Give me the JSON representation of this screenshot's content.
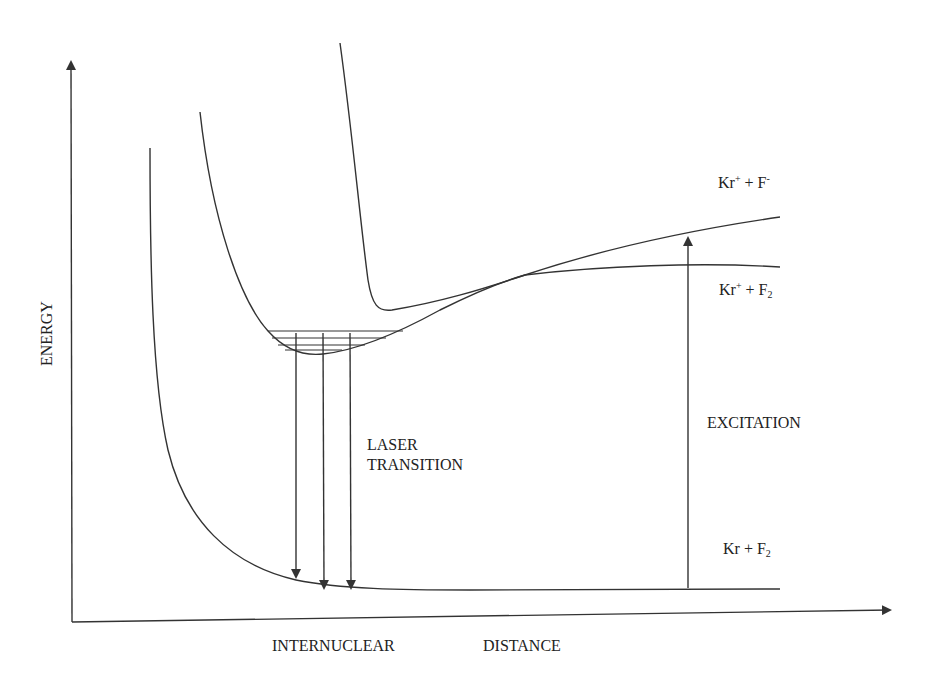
{
  "diagram": {
    "axes": {
      "y_label": "ENERGY",
      "x_label_1": "INTERNUCLEAR",
      "x_label_2": "DISTANCE"
    },
    "curves": [
      {
        "name": "ground-state-curve",
        "asymptote_label": {
          "base1": "Kr",
          "sup1": "",
          "mid": " + ",
          "base2": "F",
          "sub2": "2"
        }
      },
      {
        "name": "ionic-excited-curve",
        "asymptote_label": {
          "base1": "Kr",
          "sup1": "+",
          "mid": " + ",
          "base2": "F",
          "sup2": "-"
        }
      },
      {
        "name": "covalent-excited-curve",
        "asymptote_label": {
          "base1": "Kr",
          "sup1": "+",
          "mid": " + ",
          "base2": "F",
          "sub2": "2"
        }
      }
    ],
    "labels": {
      "kr_ion_f_ion": {
        "kr": "Kr",
        "plus_sup": "+",
        "op": " + ",
        "f": "F",
        "minus_sup": "-"
      },
      "kr_ion_f2": {
        "kr": "Kr",
        "plus_sup": "+",
        "op": " + ",
        "f": "F",
        "sub": "2"
      },
      "kr_f2": {
        "kr": "Kr",
        "op": " + ",
        "f": "F",
        "sub": "2"
      },
      "excitation": "EXCITATION",
      "laser_line1": "LASER",
      "laser_line2": "TRANSITION"
    },
    "vibrational_levels": 4,
    "laser_transition_arrows": 3,
    "colors": {
      "line": "#333333",
      "text": "#222222",
      "background": "#ffffff"
    }
  }
}
